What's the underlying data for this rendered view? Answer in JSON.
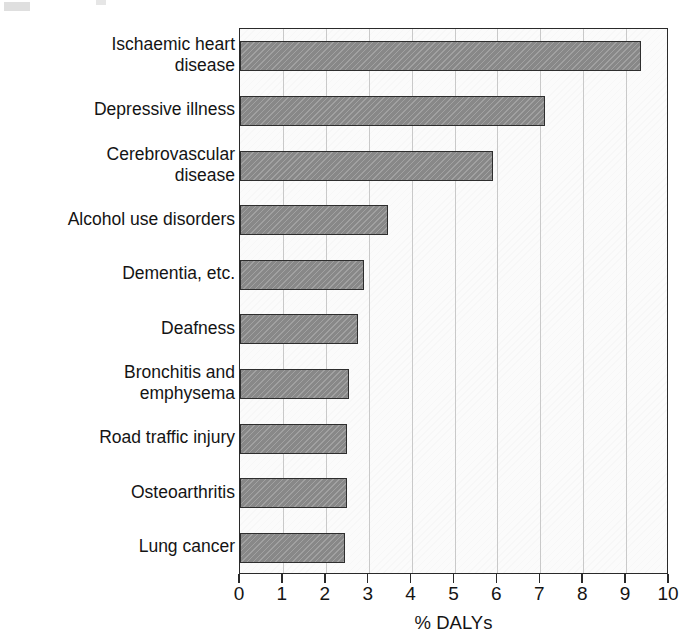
{
  "chart_data": {
    "type": "bar",
    "orientation": "horizontal",
    "title": "",
    "xlabel": "% DALYs",
    "ylabel": "",
    "xlim": [
      0,
      10
    ],
    "ylim": null,
    "grid": "vertical",
    "legend": null,
    "xticks": [
      "0",
      "1",
      "2",
      "3",
      "4",
      "5",
      "6",
      "7",
      "8",
      "9",
      "10"
    ],
    "categories": [
      "Ischaemic heart\ndisease",
      "Depressive illness",
      "Cerebrovascular\ndisease",
      "Alcohol use disorders",
      "Dementia, etc.",
      "Deafness",
      "Bronchitis and\nemphysema",
      "Road traffic injury",
      "Osteoarthritis",
      "Lung cancer"
    ],
    "values": [
      9.35,
      7.1,
      5.9,
      3.45,
      2.9,
      2.75,
      2.55,
      2.5,
      2.5,
      2.45
    ],
    "bar_color": "#8f8f8f",
    "bar_edge_color": "#2e2e2e",
    "plot_background": "#fbfbfb",
    "gridline_color": "#c9c9c9",
    "axis_color": "#2a2a2a"
  }
}
